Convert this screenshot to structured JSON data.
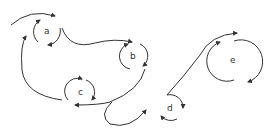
{
  "diagram": {
    "type": "state-flow",
    "stroke_color": "#333333",
    "background": "#ffffff",
    "nodes": [
      {
        "id": "a",
        "label": "a",
        "cx": 47,
        "cy": 31,
        "r": 14
      },
      {
        "id": "b",
        "label": "b",
        "cx": 133,
        "cy": 56,
        "r": 13
      },
      {
        "id": "c",
        "label": "c",
        "cx": 81,
        "cy": 92,
        "r": 13
      },
      {
        "id": "d",
        "label": "d",
        "cx": 170,
        "cy": 108,
        "r": 13
      },
      {
        "id": "e",
        "label": "e",
        "cx": 233,
        "cy": 60,
        "r": 19
      }
    ],
    "edges": [
      {
        "from": "start",
        "to": "a"
      },
      {
        "from": "a",
        "to": "b"
      },
      {
        "from": "c",
        "to": "a"
      },
      {
        "from": "b",
        "to": "c"
      },
      {
        "from": "c",
        "to": "d"
      },
      {
        "from": "d",
        "to": "e"
      }
    ]
  }
}
